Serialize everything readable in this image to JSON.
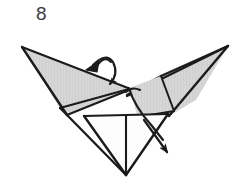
{
  "figure": {
    "step_label": "8",
    "kind": "origami-fold-diagram",
    "background_color": "#ffffff"
  },
  "colors": {
    "paper_light": "#d8d8d8",
    "paper_mid": "#cdcdcd",
    "paper_white": "#fdfdfd",
    "outline": "#1b1b1b",
    "crease": "#2a2a2a",
    "arrow": "#1b1b1b",
    "number": "#3a3a3a"
  },
  "shapes": {
    "left_wing_upper": {
      "name": "left-wing-upper-panel",
      "fill": "#d4d4d4",
      "points": "22,47 128,88 60,108"
    },
    "left_wing_lower": {
      "name": "left-wing-lower-panel",
      "fill": "#cccccc",
      "points": "22,47 60,108 66,114 128,89"
    },
    "right_wing_upper": {
      "name": "right-wing-upper-panel",
      "fill": "#d6d6d6",
      "points": "228,46 160,76 130,92 125,96"
    },
    "right_wing_lower": {
      "name": "right-wing-lower-panel",
      "fill": "#cfcfcf",
      "points": "228,46 125,96 168,116"
    },
    "center_flap": {
      "name": "center-flap-panel",
      "fill": "#d2d2d2",
      "points": "128,88 160,77 172,112 136,116"
    },
    "body_front": {
      "name": "body-front-triangle",
      "fill": "#fdfdfd",
      "points": "84,116 167,114 126,174"
    },
    "body_inner_left": {
      "name": "body-inner-left-triangle",
      "fill": "#fefefe",
      "points": "84,116 126,116 126,174"
    }
  },
  "creases": [
    {
      "name": "crease-center-spine",
      "d": "M126,116 L126,174"
    },
    {
      "name": "crease-horizontal-body",
      "d": "M84,116 L167,114"
    },
    {
      "name": "crease-body-left-edge",
      "d": "M84,116 L126,174"
    },
    {
      "name": "crease-body-right-edge",
      "d": "M167,114 L126,174"
    },
    {
      "name": "crease-left-wing-fold",
      "d": "M22,47 L128,89"
    },
    {
      "name": "crease-left-wing-lower",
      "d": "M22,47 L66,114"
    },
    {
      "name": "crease-left-to-body",
      "d": "M60,108 L128,88"
    },
    {
      "name": "crease-right-wing-fold",
      "d": "M228,46 L125,96"
    },
    {
      "name": "crease-right-wing-upper",
      "d": "M228,46 L160,77"
    },
    {
      "name": "crease-right-lower-edge",
      "d": "M228,46 L168,116"
    },
    {
      "name": "crease-center-flap-right",
      "d": "M160,77 L172,112"
    },
    {
      "name": "crease-center-flap-bottom",
      "d": "M136,116 L172,112"
    },
    {
      "name": "crease-curved-flap",
      "d": "M128,88 Q140,104 160,130"
    }
  ],
  "arrows": [
    {
      "name": "fold-over-arrow-top",
      "type": "curved-fold-arrow",
      "direction": "down-left",
      "description": "curved arrow over left wing indicating a fold back"
    },
    {
      "name": "pull-down-arrow-bottom-right",
      "type": "straight-pull-arrow",
      "direction": "down-right",
      "description": "arrow indicating pulling the flap downward"
    }
  ]
}
